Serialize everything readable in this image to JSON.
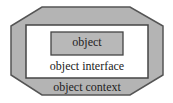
{
  "diagram": {
    "outer": {
      "label": "object context",
      "fill": "#b4b4b4",
      "stroke": "#555555"
    },
    "middle": {
      "label": "object interface",
      "fill": "#ffffff",
      "stroke": "#444444"
    },
    "inner": {
      "label": "object",
      "fill": "#b8b8b8",
      "stroke": "#444444"
    }
  }
}
